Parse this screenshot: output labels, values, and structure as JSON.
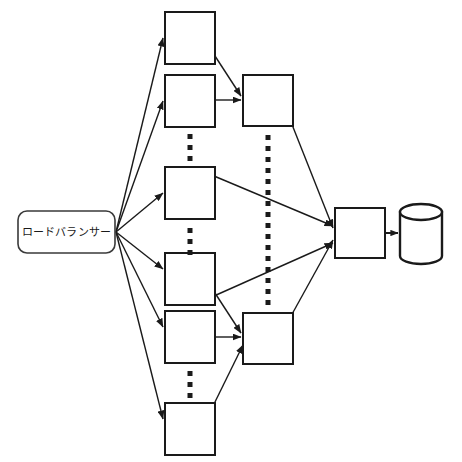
{
  "diagram": {
    "title": "",
    "background_color": "#ffffff",
    "stroke_color": "#1a1a1a",
    "node_fill": "#ffffff",
    "canvas": {
      "width": 462,
      "height": 462
    },
    "load_balancer": {
      "label": "ロードバランサー",
      "shape": "rounded-rectangle",
      "x": 18,
      "y": 211,
      "width": 97,
      "height": 42,
      "corner_radius": 9
    },
    "app_servers": {
      "shape": "rectangle",
      "count": 6,
      "width": 50,
      "height": 52,
      "boxes": [
        {
          "name": "app-server-1",
          "x": 165,
          "y": 12
        },
        {
          "name": "app-server-2",
          "x": 165,
          "y": 75
        },
        {
          "name": "app-server-3",
          "x": 165,
          "y": 167
        },
        {
          "name": "app-server-4",
          "x": 165,
          "y": 253
        },
        {
          "name": "app-server-5",
          "x": 165,
          "y": 311
        },
        {
          "name": "app-server-6",
          "x": 165,
          "y": 403
        }
      ]
    },
    "mid_servers": {
      "shape": "rectangle",
      "count": 2,
      "width": 50,
      "height": 51,
      "boxes": [
        {
          "name": "mid-server-top",
          "x": 243,
          "y": 75
        },
        {
          "name": "mid-server-bottom",
          "x": 243,
          "y": 313
        }
      ]
    },
    "aggregator": {
      "name": "aggregator-server",
      "shape": "rectangle",
      "x": 335,
      "y": 208,
      "width": 50,
      "height": 50
    },
    "database": {
      "name": "database-cylinder",
      "shape": "cylinder",
      "cx": 421,
      "top_y": 212,
      "bottom_y": 256,
      "rx": 21,
      "ry": 8
    },
    "ellipsis_groups": [
      {
        "name": "ellipsis-column1-upper",
        "x": 190,
        "y_start": 134,
        "dots": 3,
        "gap": 11,
        "size": 5
      },
      {
        "name": "ellipsis-column1-middle",
        "x": 190,
        "y_start": 228,
        "dots": 3,
        "gap": 11,
        "size": 5
      },
      {
        "name": "ellipsis-column1-lower",
        "x": 190,
        "y_start": 371,
        "dots": 3,
        "gap": 11,
        "size": 5
      },
      {
        "name": "ellipsis-column2-vertical",
        "x": 268,
        "y_start": 135,
        "dots": 16,
        "gap": 11,
        "size": 5
      }
    ],
    "edges": {
      "fan_out_origin": {
        "x": 116,
        "y": 232
      },
      "from_load_balancer": [
        {
          "name": "edge-lb-to-app-1",
          "to_x": 163,
          "to_y": 38
        },
        {
          "name": "edge-lb-to-app-2",
          "to_x": 163,
          "to_y": 101
        },
        {
          "name": "edge-lb-to-app-3",
          "to_x": 163,
          "to_y": 193
        },
        {
          "name": "edge-lb-to-app-4",
          "to_x": 163,
          "to_y": 269
        },
        {
          "name": "edge-lb-to-app-5",
          "to_x": 163,
          "to_y": 327
        },
        {
          "name": "edge-lb-to-app-6",
          "to_x": 163,
          "to_y": 419
        }
      ],
      "to_mid_top": [
        {
          "name": "edge-app1-to-mid-top",
          "from_x": 215,
          "from_y": 56,
          "to_x": 241,
          "to_y": 96
        },
        {
          "name": "edge-app2-to-mid-top",
          "from_x": 216,
          "from_y": 100,
          "to_x": 241,
          "to_y": 100
        }
      ],
      "to_mid_bottom": [
        {
          "name": "edge-app4-to-mid-bottom",
          "from_x": 213,
          "from_y": 290,
          "to_x": 241,
          "to_y": 333
        },
        {
          "name": "edge-app5-to-mid-bottom",
          "from_x": 216,
          "from_y": 337,
          "to_x": 241,
          "to_y": 337
        },
        {
          "name": "edge-app6-to-mid-bottom",
          "from_x": 214,
          "from_y": 404,
          "to_x": 243,
          "to_y": 345
        }
      ],
      "to_aggregator": [
        {
          "name": "edge-mid-top-to-aggregator",
          "from_x": 291,
          "from_y": 122,
          "to_x": 333,
          "to_y": 228
        },
        {
          "name": "edge-mid-bottom-to-aggregator",
          "from_x": 291,
          "from_y": 316,
          "to_x": 333,
          "to_y": 240
        },
        {
          "name": "edge-app3-to-aggregator",
          "from_x": 214,
          "from_y": 176,
          "to_x": 333,
          "to_y": 226
        },
        {
          "name": "edge-app4-to-aggregator",
          "from_x": 214,
          "from_y": 296,
          "to_x": 333,
          "to_y": 243
        }
      ],
      "to_database": [
        {
          "name": "edge-aggregator-to-database",
          "from_x": 385,
          "from_y": 233,
          "to_x": 398,
          "to_y": 233
        }
      ]
    }
  }
}
